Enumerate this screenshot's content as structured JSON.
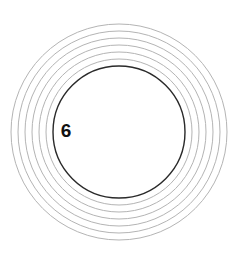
{
  "figure": {
    "background_color": "#ffffff",
    "width": 241,
    "height": 263,
    "center_x": 119,
    "center_y": 132
  },
  "chart_data": {
    "type": "scatter",
    "xlabel": "",
    "ylabel": "",
    "grid": false,
    "legend": null,
    "xlim": [
      0,
      241
    ],
    "ylim": [
      0,
      263
    ],
    "annotations": [
      {
        "text": "6",
        "x": 66,
        "y": 132
      }
    ],
    "series": [
      {
        "name": "outer-rings",
        "shape": "circle",
        "center": [
          119,
          132
        ],
        "stroke": "#b4b4b4",
        "stroke_width": 1,
        "fill": "none",
        "radii": [
          108,
          101,
          94,
          87,
          80,
          73
        ]
      },
      {
        "name": "inner-circle",
        "shape": "circle",
        "center": [
          119,
          132
        ],
        "stroke": "#2a2a2a",
        "stroke_width": 1.4,
        "fill": "none",
        "radii": [
          66
        ]
      }
    ]
  },
  "label": {
    "text": "6",
    "color": "#111111",
    "font_size": 19
  },
  "colors": {
    "ring_stroke": "#b4b4b4",
    "inner_stroke": "#2a2a2a",
    "label_color": "#111111",
    "background": "#ffffff"
  }
}
